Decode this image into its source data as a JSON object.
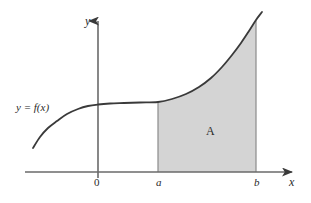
{
  "figure": {
    "caption_visible": false,
    "width": 311,
    "height": 203,
    "background_color": "#ffffff"
  },
  "axes": {
    "x_axis_label": "x",
    "y_axis_label": "y",
    "origin_label": "0",
    "axis_color": "#5a5a5a"
  },
  "ticks": {
    "lower_limit_label": "a",
    "upper_limit_label": "b"
  },
  "curve": {
    "label": "y = f(x)",
    "color": "#3a3a3a"
  },
  "region": {
    "label": "A",
    "fill_color": "#d4d4d4",
    "edge_color": "#888888"
  },
  "chart_data": {
    "type": "area",
    "title": "",
    "xlabel": "x",
    "ylabel": "y",
    "grid": false,
    "legend": "none",
    "annotations": [
      {
        "text": "y = f(x)",
        "role": "curve-label"
      },
      {
        "text": "A",
        "role": "region-label"
      },
      {
        "text": "0",
        "role": "origin-tick"
      },
      {
        "text": "a",
        "role": "x-tick"
      },
      {
        "text": "b",
        "role": "x-tick"
      }
    ],
    "series": [
      {
        "name": "y = f(x)",
        "points": [
          [
            33,
            148
          ],
          [
            40,
            137
          ],
          [
            48,
            128
          ],
          [
            57,
            121
          ],
          [
            67,
            114
          ],
          [
            78,
            109
          ],
          [
            88,
            106
          ],
          [
            98,
            104.5
          ],
          [
            110,
            103.5
          ],
          [
            124,
            103
          ],
          [
            140,
            102.5
          ],
          [
            158,
            102
          ],
          [
            172,
            99
          ],
          [
            186,
            94
          ],
          [
            199,
            87
          ],
          [
            211,
            78
          ],
          [
            222,
            67
          ],
          [
            232,
            55
          ],
          [
            241,
            43
          ],
          [
            249,
            31
          ],
          [
            256,
            20
          ],
          [
            262,
            12
          ]
        ]
      }
    ],
    "shaded_region": {
      "label": "A",
      "x_from_label": "a",
      "x_to_label": "b",
      "x_from_px": 158,
      "x_to_px": 256,
      "baseline_px": 172
    },
    "axis_pixels": {
      "y_axis_x": 98,
      "x_axis_y": 172,
      "x_axis_start": 25,
      "x_axis_end": 295,
      "y_axis_top": 18,
      "y_axis_bottom": 178
    }
  }
}
